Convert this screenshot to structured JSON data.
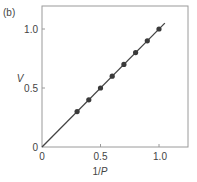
{
  "panel_label": "(b)",
  "chart_data": {
    "type": "scatter",
    "title": "",
    "xlabel": "1/P",
    "ylabel": "V",
    "xlim": [
      0,
      1.25
    ],
    "ylim": [
      0,
      1.2
    ],
    "x_ticks": [
      "0",
      "0.5",
      "1.0"
    ],
    "y_ticks": [
      "0",
      "0.5",
      "1.0"
    ],
    "grid": false,
    "legend": null,
    "series": [
      {
        "name": "data points",
        "x": [
          0.3,
          0.4,
          0.5,
          0.6,
          0.7,
          0.8,
          0.9,
          1.0
        ],
        "y": [
          0.3,
          0.4,
          0.5,
          0.6,
          0.7,
          0.8,
          0.9,
          1.0
        ]
      },
      {
        "name": "fit line",
        "type": "line",
        "x": [
          0,
          1.05
        ],
        "y": [
          0,
          1.05
        ]
      }
    ]
  },
  "colors": {
    "axis": "#9a9a9a",
    "line": "#444444",
    "marker": "#3a3a3a",
    "text": "#444444"
  }
}
